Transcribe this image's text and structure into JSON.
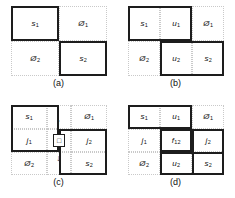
{
  "figure": {
    "panels": [
      {
        "id": "a",
        "caption": "(a)",
        "columns": 2,
        "rows": 2,
        "cells": [
          {
            "row": 0,
            "col": 0,
            "base": "s",
            "sub": "1",
            "emphasis": "thick"
          },
          {
            "row": 0,
            "col": 1,
            "base": "Ø",
            "sub": "1",
            "emphasis": "dotted"
          },
          {
            "row": 1,
            "col": 0,
            "base": "Ø",
            "sub": "2",
            "emphasis": "dotted"
          },
          {
            "row": 1,
            "col": 1,
            "base": "s",
            "sub": "2",
            "emphasis": "thick"
          }
        ]
      },
      {
        "id": "b",
        "caption": "(b)",
        "columns": 3,
        "rows": 2,
        "cells": [
          {
            "row": 0,
            "col": 0,
            "base": "s",
            "sub": "1",
            "emphasis": "thick"
          },
          {
            "row": 0,
            "col": 1,
            "base": "u",
            "sub": "1",
            "emphasis": "thick"
          },
          {
            "row": 0,
            "col": 2,
            "base": "Ø",
            "sub": "1",
            "emphasis": "dotted"
          },
          {
            "row": 1,
            "col": 0,
            "base": "Ø",
            "sub": "2",
            "emphasis": "dotted"
          },
          {
            "row": 1,
            "col": 1,
            "base": "u",
            "sub": "2",
            "emphasis": "thick"
          },
          {
            "row": 1,
            "col": 2,
            "base": "s",
            "sub": "2",
            "emphasis": "thick"
          }
        ]
      },
      {
        "id": "c",
        "caption": "(c)",
        "columns": 3,
        "rows": 3,
        "cells": [
          {
            "row": 0,
            "col": 0,
            "base": "s",
            "sub": "1",
            "emphasis": "thick"
          },
          {
            "row": 0,
            "col": 2,
            "base": "Ø",
            "sub": "1",
            "emphasis": "dotted"
          },
          {
            "row": 1,
            "col": 0,
            "base": "j",
            "sub": "1",
            "emphasis": "thick"
          },
          {
            "row": 1,
            "col": 2,
            "base": "j",
            "sub": "2",
            "emphasis": "thick"
          },
          {
            "row": 2,
            "col": 0,
            "base": "Ø",
            "sub": "2",
            "emphasis": "dotted"
          },
          {
            "row": 2,
            "col": 2,
            "base": "s",
            "sub": "2",
            "emphasis": "thick"
          }
        ],
        "center_symbol": "□",
        "arrow_up": "↑",
        "arrow_down": "↓"
      },
      {
        "id": "d",
        "caption": "(d)",
        "columns": 3,
        "rows": 3,
        "cells": [
          {
            "row": 0,
            "col": 0,
            "base": "s",
            "sub": "1",
            "emphasis": "thick"
          },
          {
            "row": 0,
            "col": 1,
            "base": "u",
            "sub": "1",
            "emphasis": "thick"
          },
          {
            "row": 0,
            "col": 2,
            "base": "Ø",
            "sub": "1",
            "emphasis": "dotted"
          },
          {
            "row": 1,
            "col": 0,
            "base": "j",
            "sub": "1",
            "emphasis": "dotted"
          },
          {
            "row": 1,
            "col": 1,
            "base": "f",
            "sub": "12",
            "emphasis": "thick"
          },
          {
            "row": 1,
            "col": 2,
            "base": "j",
            "sub": "2",
            "emphasis": "thick"
          },
          {
            "row": 2,
            "col": 0,
            "base": "Ø",
            "sub": "2",
            "emphasis": "dotted"
          },
          {
            "row": 2,
            "col": 1,
            "base": "u",
            "sub": "2",
            "emphasis": "thick"
          },
          {
            "row": 2,
            "col": 2,
            "base": "s",
            "sub": "2",
            "emphasis": "thick"
          }
        ]
      }
    ]
  },
  "colors": {
    "block_border": "#1d1d1d",
    "guide_border": "#c9c9c9",
    "text": "#111111",
    "background": "#ffffff"
  }
}
